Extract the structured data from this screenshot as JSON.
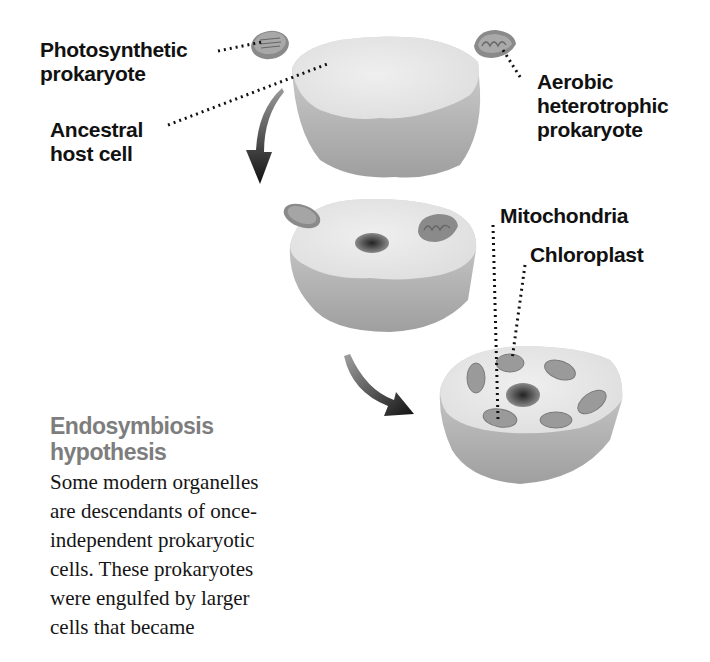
{
  "labels": {
    "photosynthetic_prokaryote": [
      "Photosynthetic",
      "prokaryote"
    ],
    "ancestral_host_cell": [
      "Ancestral",
      "host cell"
    ],
    "aerobic_heterotrophic_prokaryote": [
      "Aerobic",
      "heterotrophic",
      "prokaryote"
    ],
    "mitochondria": "Mitochondria",
    "chloroplast": "Chloroplast"
  },
  "caption": {
    "title": [
      "Endosymbiosis",
      "hypothesis"
    ],
    "body": [
      "Some modern organelles",
      "are descendants of once-",
      "independent prokaryotic",
      "cells. These prokaryotes",
      "were engulfed by larger",
      "cells that became"
    ]
  },
  "colors": {
    "background": "#ffffff",
    "label_text": "#111111",
    "caption_title": "#7d7d7d",
    "cell_top": "#e9e9e9",
    "cell_side": "#bdbdbd",
    "organelle": "#8f8f8f",
    "arrow": "#1a1a1a"
  },
  "stages": [
    {
      "name": "ancestral-host-cell",
      "contents": [
        "photosynthetic prokaryote (outside)",
        "aerobic heterotrophic prokaryote (outside)"
      ]
    },
    {
      "name": "engulfing-cell",
      "contents": [
        "nucleus",
        "mitochondrion",
        "chloroplast"
      ]
    },
    {
      "name": "modern-eukaryotic-cell",
      "contents": [
        "nucleus",
        "mitochondria",
        "chloroplasts"
      ]
    }
  ]
}
